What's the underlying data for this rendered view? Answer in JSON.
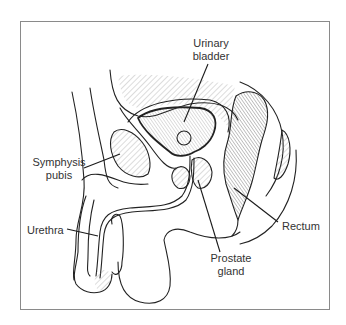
{
  "figure": {
    "labels": {
      "urinary_bladder": "Urinary bladder",
      "symphysis_pubis": "Symphysis pubis",
      "urethra": "Urethra",
      "rectum": "Rectum",
      "prostate_gland": "Prostate gland"
    },
    "colors": {
      "line": "#222222",
      "frame": "#8a8a8a",
      "background": "#ffffff",
      "text": "#333333"
    }
  }
}
